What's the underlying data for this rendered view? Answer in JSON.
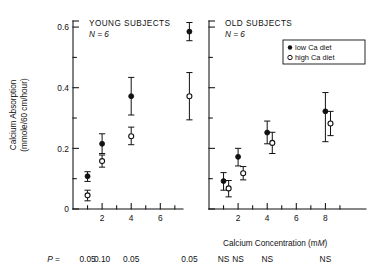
{
  "chart_data": {
    "type": "scatter",
    "title": "",
    "xlabel": "Calcium Concentration (mM)",
    "ylabel_line1": "Calcium Absorption",
    "ylabel_line2": "(mmole/60 cm/hour)",
    "xlim": [
      0,
      9.4
    ],
    "ylim": [
      0,
      0.62
    ],
    "x_ticks_major": [
      2,
      4,
      6,
      8
    ],
    "x_ticks_minor": [
      1,
      3,
      5,
      7,
      9
    ],
    "y_ticks_major": [
      0,
      0.2,
      0.4,
      0.6
    ],
    "y_ticks_minor": [
      0.1,
      0.3,
      0.5
    ],
    "y_tick_labels": [
      "0",
      "0.2",
      "0.4",
      "0.6"
    ],
    "x_tick_labels": [
      "2",
      "4",
      "6",
      "8"
    ],
    "grid": false,
    "legend_position": "top-right of right panel",
    "legend": [
      {
        "marker": "filled-circle",
        "label": "low Ca diet"
      },
      {
        "marker": "open-circle",
        "label": "high Ca diet"
      }
    ],
    "panels": [
      {
        "name": "young",
        "title": "YOUNG SUBJECTS",
        "n_label": "N = 6",
        "series": [
          {
            "name": "low Ca diet",
            "marker": "filled-circle",
            "x": [
              1,
              2,
              4,
              8
            ],
            "values": [
              0.108,
              0.215,
              0.372,
              0.585
            ],
            "err_low": [
              0.017,
              0.032,
              0.062,
              0.03
            ],
            "err_high": [
              0.015,
              0.033,
              0.062,
              0.03
            ]
          },
          {
            "name": "high Ca diet",
            "marker": "open-circle",
            "x": [
              1,
              2,
              4,
              8
            ],
            "values": [
              0.045,
              0.158,
              0.24,
              0.372
            ],
            "err_low": [
              0.018,
              0.02,
              0.028,
              0.078
            ],
            "err_high": [
              0.017,
              0.02,
              0.03,
              0.078
            ]
          }
        ],
        "significance": [
          {
            "x": 1,
            "text": "0.05"
          },
          {
            "x": 2,
            "text": "0.10"
          },
          {
            "x": 4,
            "text": "0.05"
          },
          {
            "x": 8,
            "text": "0.05"
          }
        ],
        "significance_prefix_italic": "P",
        "significance_prefix_rest": "="
      },
      {
        "name": "old",
        "title": "OLD SUBJECTS",
        "n_label": "N = 6",
        "series": [
          {
            "name": "low Ca diet",
            "marker": "filled-circle",
            "x": [
              1,
              2,
              4,
              8
            ],
            "values": [
              0.092,
              0.172,
              0.252,
              0.322
            ],
            "err_low": [
              0.03,
              0.03,
              0.037,
              0.1
            ],
            "err_high": [
              0.028,
              0.028,
              0.038,
              0.062
            ]
          },
          {
            "name": "high Ca diet",
            "marker": "open-circle",
            "x": [
              1.35,
              2.35,
              4.35,
              8.35
            ],
            "values": [
              0.068,
              0.118,
              0.218,
              0.282
            ],
            "err_low": [
              0.028,
              0.022,
              0.035,
              0.04
            ],
            "err_high": [
              0.026,
              0.022,
              0.035,
              0.04
            ]
          }
        ],
        "significance": [
          {
            "x": 1,
            "text": "NS"
          },
          {
            "x": 2,
            "text": "NS"
          },
          {
            "x": 4,
            "text": "NS"
          },
          {
            "x": 8,
            "text": "NS"
          }
        ]
      }
    ]
  }
}
